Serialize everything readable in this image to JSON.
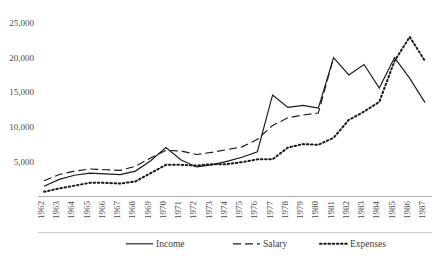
{
  "chart_data": {
    "type": "line",
    "title": "",
    "subtitle": "",
    "xlabel": "",
    "ylabel": "",
    "grid": false,
    "legend_position": "bottom",
    "x": [
      1962,
      1963,
      1964,
      1965,
      1966,
      1967,
      1968,
      1969,
      1970,
      1971,
      1972,
      1973,
      1974,
      1975,
      1976,
      1977,
      1978,
      1979,
      1980,
      1981,
      1982,
      1983,
      1984,
      1985,
      1986,
      1987
    ],
    "xtick_labels": [
      "1962",
      "1963",
      "1964",
      "1965",
      "1966",
      "1967",
      "1968",
      "1969",
      "1970",
      "1971",
      "1972",
      "1973",
      "1974",
      "1975",
      "1976",
      "1977",
      "1978",
      "1979",
      "1980",
      "1981",
      "1982",
      "1983",
      "1984",
      "1985",
      "1986",
      "1987"
    ],
    "ytick_labels": [
      "5,000",
      "10,000",
      "15,000",
      "20,000",
      "25,000"
    ],
    "ytick_values": [
      5000,
      10000,
      15000,
      20000,
      25000
    ],
    "ylim": [
      0,
      26500
    ],
    "xlim": [
      1962,
      1987
    ],
    "series": [
      {
        "name": "Income",
        "style": "solid",
        "color": "#1a1a1a",
        "values": [
          1400,
          2400,
          3000,
          3300,
          3200,
          3100,
          3600,
          5100,
          7000,
          5200,
          4200,
          4500,
          5000,
          5600,
          6400,
          14600,
          12800,
          13100,
          12700,
          20000,
          17500,
          19000,
          15600,
          20000,
          17000,
          13500
        ]
      },
      {
        "name": "Salary",
        "style": "dashed",
        "color": "#1a1a1a",
        "values": [
          2200,
          3100,
          3600,
          3900,
          3800,
          3700,
          4300,
          5500,
          6600,
          6500,
          6000,
          6300,
          6700,
          7100,
          8200,
          10200,
          11300,
          11700,
          12000,
          20000,
          null,
          null,
          null,
          null,
          null,
          null
        ]
      },
      {
        "name": "Expenses",
        "style": "dotted",
        "color": "#1a1a1a",
        "values": [
          600,
          1100,
          1500,
          1900,
          1900,
          1800,
          2100,
          3300,
          4500,
          4500,
          4400,
          4600,
          4600,
          4900,
          5300,
          5300,
          7000,
          7500,
          7400,
          8400,
          11000,
          12200,
          13600,
          19500,
          23000,
          19500
        ]
      }
    ],
    "legend": [
      {
        "label": "Income",
        "style": "solid"
      },
      {
        "label": "Salary",
        "style": "dashed"
      },
      {
        "label": "Expenses",
        "style": "dotted"
      }
    ]
  }
}
